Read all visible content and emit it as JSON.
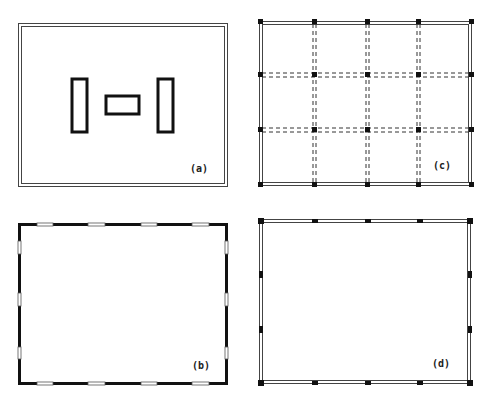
{
  "figure": {
    "panels": [
      {
        "id": "a",
        "label": "(a)",
        "description": "Double-line outer wall enclosing three isolated interior core rectangles"
      },
      {
        "id": "b",
        "label": "(b)",
        "description": "Perimeter of thick solid wall segments with window openings"
      },
      {
        "id": "c",
        "label": "(c)",
        "description": "Perimeter frame with columns and dashed interior beam grid"
      },
      {
        "id": "d",
        "label": "(d)",
        "description": "Perimeter frame of double-line beams with columns only at perimeter"
      }
    ]
  }
}
